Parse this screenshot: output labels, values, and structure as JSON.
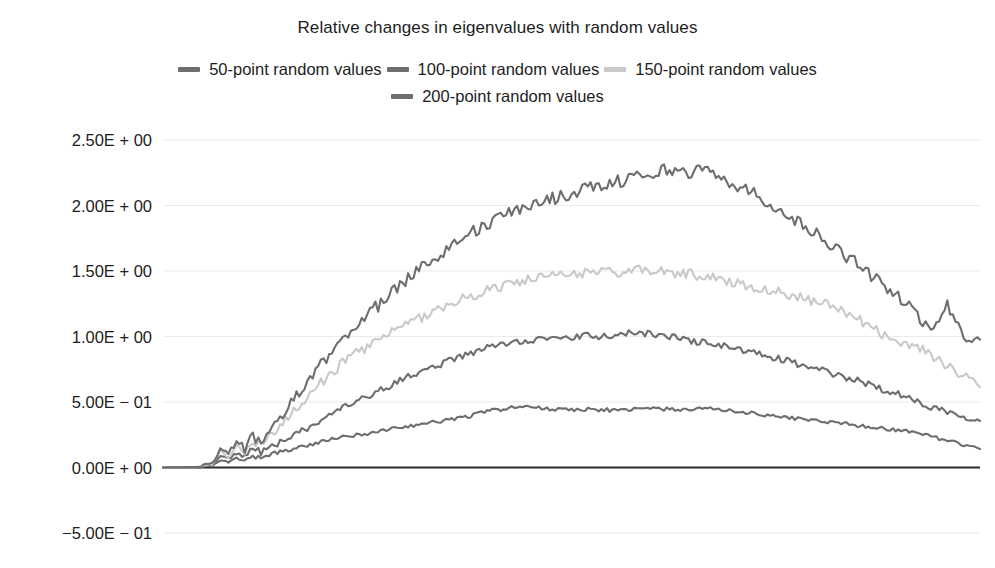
{
  "chart_data": {
    "type": "line",
    "title": "Relative changes in eigenvalues with random values",
    "xlabel": "",
    "ylabel": "",
    "grid": true,
    "legend_position": "top-center",
    "ylim": [
      -0.5,
      2.5
    ],
    "ytick_labels": [
      "2.50E + 00",
      "2.00E + 00",
      "1.50E + 00",
      "1.00E + 00",
      "5.00E − 01",
      "0.00E + 00",
      "−5.00E − 01"
    ],
    "ytick_values": [
      2.5,
      2.0,
      1.5,
      1.0,
      0.5,
      0.0,
      -0.5
    ],
    "xlim": [
      0,
      1
    ],
    "xtick_labels": [],
    "series": [
      {
        "name": "50-point random values",
        "color": "#6e6e6e",
        "x": [
          0.0,
          0.02,
          0.04,
          0.06,
          0.065,
          0.07,
          0.08,
          0.09,
          0.1,
          0.11,
          0.12,
          0.13,
          0.14,
          0.15,
          0.16,
          0.17,
          0.18,
          0.19,
          0.2,
          0.22,
          0.24,
          0.26,
          0.28,
          0.3,
          0.32,
          0.34,
          0.36,
          0.38,
          0.4,
          0.42,
          0.44,
          0.46,
          0.48,
          0.5,
          0.52,
          0.54,
          0.56,
          0.58,
          0.6,
          0.62,
          0.64,
          0.66,
          0.68,
          0.7,
          0.72,
          0.74,
          0.76,
          0.78,
          0.8,
          0.82,
          0.84,
          0.86,
          0.88,
          0.9,
          0.92,
          0.94,
          0.96,
          0.98,
          1.0
        ],
        "values": [
          0.0,
          0.005,
          0.008,
          0.012,
          0.03,
          0.055,
          0.04,
          0.07,
          0.05,
          0.085,
          0.07,
          0.1,
          0.115,
          0.125,
          0.145,
          0.16,
          0.175,
          0.19,
          0.205,
          0.23,
          0.25,
          0.27,
          0.295,
          0.315,
          0.335,
          0.355,
          0.375,
          0.4,
          0.435,
          0.45,
          0.465,
          0.455,
          0.445,
          0.44,
          0.445,
          0.44,
          0.435,
          0.445,
          0.45,
          0.445,
          0.44,
          0.45,
          0.445,
          0.43,
          0.415,
          0.4,
          0.385,
          0.37,
          0.36,
          0.345,
          0.33,
          0.315,
          0.3,
          0.285,
          0.27,
          0.24,
          0.2,
          0.175,
          0.15
        ]
      },
      {
        "name": "100-point random values",
        "color": "#6e6e6e",
        "x": [
          0.0,
          0.02,
          0.04,
          0.06,
          0.065,
          0.07,
          0.08,
          0.09,
          0.1,
          0.11,
          0.12,
          0.13,
          0.14,
          0.15,
          0.16,
          0.17,
          0.18,
          0.19,
          0.2,
          0.22,
          0.24,
          0.26,
          0.28,
          0.3,
          0.32,
          0.34,
          0.36,
          0.38,
          0.4,
          0.42,
          0.44,
          0.46,
          0.48,
          0.5,
          0.52,
          0.54,
          0.56,
          0.58,
          0.6,
          0.62,
          0.64,
          0.66,
          0.68,
          0.7,
          0.72,
          0.74,
          0.76,
          0.78,
          0.8,
          0.82,
          0.84,
          0.86,
          0.88,
          0.9,
          0.92,
          0.94,
          0.96,
          0.98,
          1.0
        ],
        "values": [
          0.0,
          0.004,
          0.01,
          0.018,
          0.055,
          0.09,
          0.065,
          0.115,
          0.09,
          0.135,
          0.12,
          0.155,
          0.18,
          0.21,
          0.245,
          0.28,
          0.315,
          0.35,
          0.385,
          0.45,
          0.51,
          0.57,
          0.63,
          0.69,
          0.74,
          0.79,
          0.835,
          0.875,
          0.92,
          0.95,
          0.965,
          0.985,
          0.975,
          0.99,
          1.005,
          1.0,
          1.015,
          1.03,
          1.02,
          1.0,
          0.975,
          0.955,
          0.935,
          0.91,
          0.875,
          0.85,
          0.82,
          0.785,
          0.75,
          0.715,
          0.68,
          0.645,
          0.6,
          0.56,
          0.51,
          0.465,
          0.43,
          0.39,
          0.37
        ]
      },
      {
        "name": "150-point random values",
        "color": "#c9c9c9",
        "x": [
          0.0,
          0.02,
          0.04,
          0.06,
          0.065,
          0.07,
          0.08,
          0.09,
          0.1,
          0.11,
          0.12,
          0.13,
          0.14,
          0.15,
          0.16,
          0.17,
          0.18,
          0.19,
          0.2,
          0.22,
          0.24,
          0.26,
          0.28,
          0.3,
          0.32,
          0.34,
          0.36,
          0.38,
          0.4,
          0.42,
          0.44,
          0.46,
          0.48,
          0.5,
          0.52,
          0.54,
          0.56,
          0.58,
          0.6,
          0.62,
          0.64,
          0.66,
          0.68,
          0.7,
          0.72,
          0.74,
          0.76,
          0.78,
          0.8,
          0.82,
          0.84,
          0.86,
          0.88,
          0.9,
          0.92,
          0.94,
          0.96,
          0.98,
          1.0
        ],
        "values": [
          0.0,
          0.006,
          0.014,
          0.025,
          0.075,
          0.13,
          0.09,
          0.16,
          0.12,
          0.2,
          0.17,
          0.24,
          0.3,
          0.355,
          0.42,
          0.48,
          0.55,
          0.62,
          0.69,
          0.8,
          0.885,
          0.96,
          1.03,
          1.095,
          1.16,
          1.22,
          1.27,
          1.315,
          1.36,
          1.395,
          1.425,
          1.445,
          1.46,
          1.475,
          1.49,
          1.5,
          1.49,
          1.505,
          1.5,
          1.49,
          1.48,
          1.465,
          1.44,
          1.41,
          1.385,
          1.36,
          1.33,
          1.3,
          1.265,
          1.225,
          1.17,
          1.1,
          1.02,
          0.965,
          0.93,
          0.86,
          0.78,
          0.7,
          0.6
        ]
      },
      {
        "name": "200-point random values",
        "color": "#6e6e6e",
        "x": [
          0.0,
          0.02,
          0.04,
          0.06,
          0.065,
          0.07,
          0.08,
          0.09,
          0.1,
          0.11,
          0.12,
          0.13,
          0.14,
          0.15,
          0.16,
          0.17,
          0.18,
          0.19,
          0.2,
          0.22,
          0.24,
          0.26,
          0.28,
          0.3,
          0.32,
          0.34,
          0.36,
          0.38,
          0.4,
          0.42,
          0.44,
          0.46,
          0.48,
          0.5,
          0.52,
          0.54,
          0.56,
          0.58,
          0.6,
          0.62,
          0.64,
          0.66,
          0.68,
          0.7,
          0.72,
          0.74,
          0.76,
          0.78,
          0.8,
          0.82,
          0.84,
          0.86,
          0.88,
          0.9,
          0.92,
          0.94,
          0.96,
          0.98,
          1.0
        ],
        "values": [
          0.0,
          0.007,
          0.016,
          0.03,
          0.085,
          0.15,
          0.105,
          0.185,
          0.14,
          0.23,
          0.195,
          0.285,
          0.36,
          0.43,
          0.51,
          0.585,
          0.665,
          0.75,
          0.835,
          0.99,
          1.11,
          1.22,
          1.33,
          1.45,
          1.55,
          1.64,
          1.73,
          1.8,
          1.865,
          1.93,
          1.98,
          2.03,
          2.06,
          2.095,
          2.13,
          2.16,
          2.19,
          2.23,
          2.245,
          2.28,
          2.255,
          2.27,
          2.23,
          2.16,
          2.1,
          2.03,
          1.95,
          1.86,
          1.78,
          1.69,
          1.6,
          1.5,
          1.4,
          1.3,
          1.18,
          1.05,
          1.24,
          1.02,
          0.95
        ]
      }
    ]
  },
  "axes": {
    "zero_line_color": "#2b2b2b",
    "grid_color": "#ebebeb"
  }
}
